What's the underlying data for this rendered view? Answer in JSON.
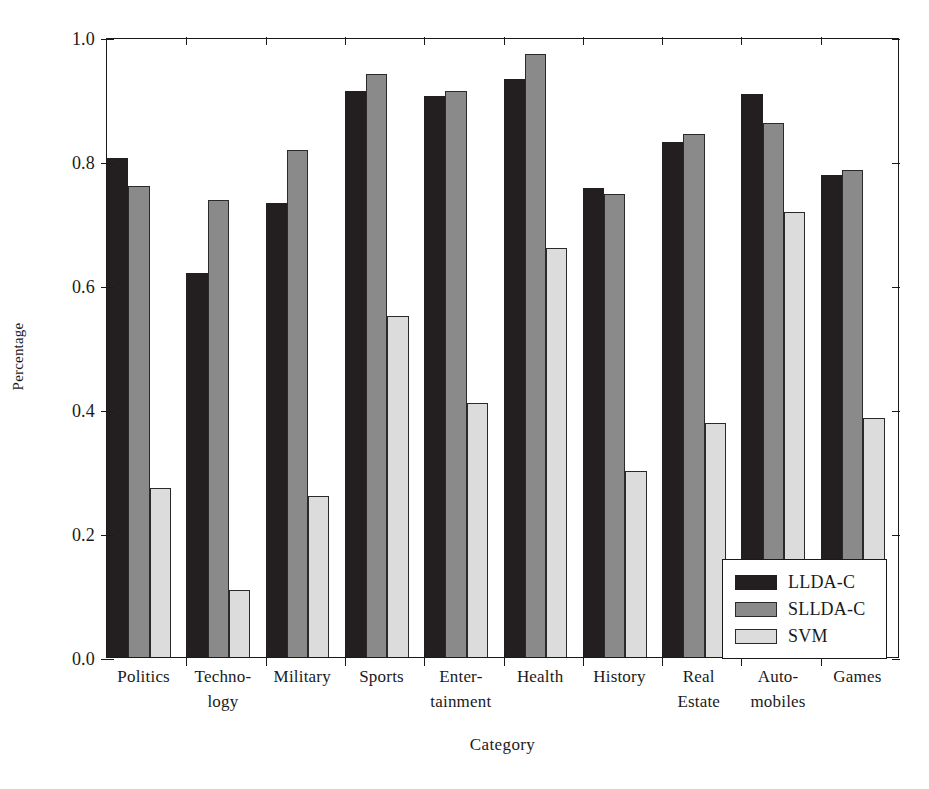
{
  "chart_data": {
    "type": "bar",
    "title": "",
    "xlabel": "Category",
    "ylabel": "Percentage",
    "ylim": [
      0.0,
      1.0
    ],
    "yticks": [
      "0.0",
      "0.2",
      "0.4",
      "0.6",
      "0.8",
      "1.0"
    ],
    "ytick_values": [
      0.0,
      0.2,
      0.4,
      0.6,
      0.8,
      1.0
    ],
    "grid": false,
    "legend_position": "lower right",
    "categories": [
      "Politics",
      "Techno- logy",
      "Military",
      "Sports",
      "Enter- tainment",
      "Health",
      "History",
      "Real Estate",
      "Auto- mobiles",
      "Games"
    ],
    "category_lines": [
      [
        "Politics"
      ],
      [
        "Techno-",
        "logy"
      ],
      [
        "Military"
      ],
      [
        "Sports"
      ],
      [
        "Enter-",
        "tainment"
      ],
      [
        "Health"
      ],
      [
        "History"
      ],
      [
        "Real",
        "Estate"
      ],
      [
        "Auto-",
        "mobiles"
      ],
      [
        "Games"
      ]
    ],
    "series": [
      {
        "name": "LLDA-C",
        "color": "#231f20",
        "values": [
          0.805,
          0.62,
          0.733,
          0.913,
          0.905,
          0.933,
          0.757,
          0.83,
          0.908,
          0.777
        ]
      },
      {
        "name": "SLLDA-C",
        "color": "#8a8a8a",
        "values": [
          0.76,
          0.737,
          0.818,
          0.941,
          0.913,
          0.973,
          0.747,
          0.843,
          0.862,
          0.785
        ]
      },
      {
        "name": "SVM",
        "color": "#dcdcdc",
        "values": [
          0.272,
          0.108,
          0.26,
          0.55,
          0.41,
          0.66,
          0.3,
          0.378,
          0.718,
          0.385
        ]
      }
    ]
  },
  "legend": {
    "items": [
      {
        "label": "LLDA-C",
        "swatch": "s0"
      },
      {
        "label": "SLLDA-C",
        "swatch": "s1"
      },
      {
        "label": "SVM",
        "swatch": "s2"
      }
    ]
  }
}
